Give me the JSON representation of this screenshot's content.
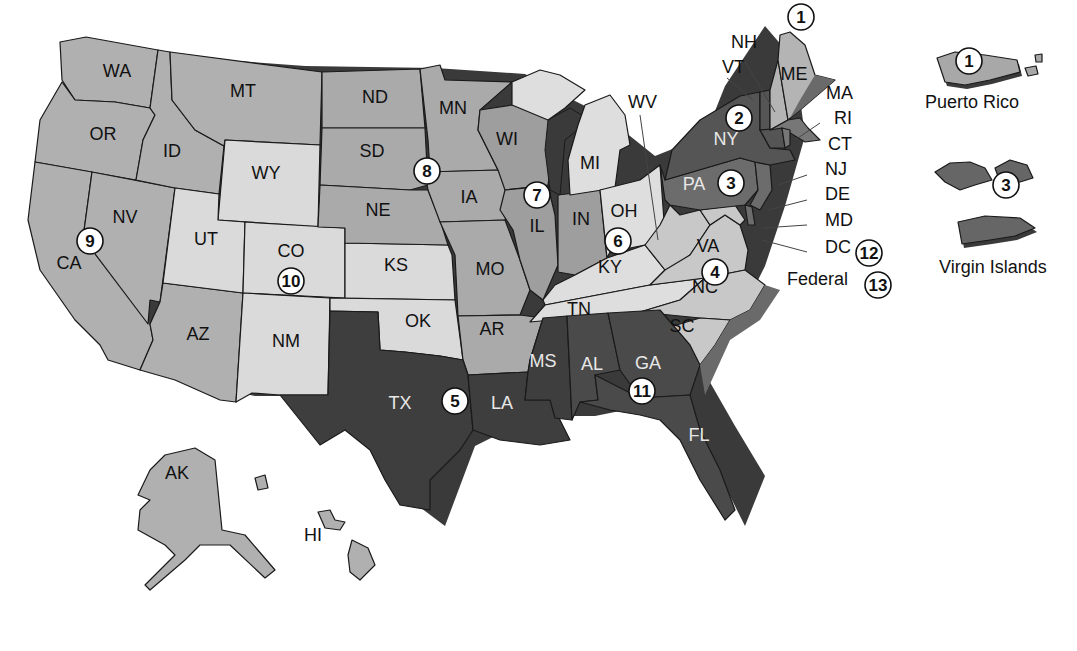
{
  "map": {
    "title": "U.S. Federal Judicial Circuits",
    "colors": {
      "lightest": "#dcdcdc",
      "light": "#c4c4c4",
      "medium": "#a8a8a8",
      "medium_dark": "#7a7a7a",
      "dark": "#5a5a5a",
      "darkest": "#3c3c3c",
      "border": "#1a1a1a",
      "badge_fill": "#ffffff"
    },
    "circuits": [
      {
        "number": "1",
        "states": [
          "ME",
          "NH",
          "MA",
          "RI",
          "Puerto Rico"
        ]
      },
      {
        "number": "2",
        "states": [
          "NY",
          "VT",
          "CT"
        ]
      },
      {
        "number": "3",
        "states": [
          "PA",
          "NJ",
          "DE",
          "Virgin Islands"
        ]
      },
      {
        "number": "4",
        "states": [
          "VA",
          "WV",
          "NC",
          "SC",
          "MD"
        ]
      },
      {
        "number": "5",
        "states": [
          "TX",
          "LA",
          "MS"
        ]
      },
      {
        "number": "6",
        "states": [
          "OH",
          "MI",
          "KY",
          "TN"
        ]
      },
      {
        "number": "7",
        "states": [
          "WI",
          "IL",
          "IN"
        ]
      },
      {
        "number": "8",
        "states": [
          "ND",
          "SD",
          "NE",
          "MN",
          "IA",
          "MO",
          "AR"
        ]
      },
      {
        "number": "9",
        "states": [
          "WA",
          "OR",
          "CA",
          "NV",
          "ID",
          "MT",
          "AZ",
          "AK",
          "HI"
        ]
      },
      {
        "number": "10",
        "states": [
          "WY",
          "UT",
          "CO",
          "KS",
          "OK",
          "NM"
        ]
      },
      {
        "number": "11",
        "states": [
          "AL",
          "GA",
          "FL"
        ]
      },
      {
        "number": "12",
        "states": [
          "DC"
        ]
      },
      {
        "number": "13",
        "states": [
          "Federal"
        ]
      }
    ],
    "state_labels": {
      "WA": "WA",
      "OR": "OR",
      "CA": "CA",
      "NV": "NV",
      "ID": "ID",
      "MT": "MT",
      "WY": "WY",
      "UT": "UT",
      "CO": "CO",
      "AZ": "AZ",
      "NM": "NM",
      "ND": "ND",
      "SD": "SD",
      "NE": "NE",
      "KS": "KS",
      "OK": "OK",
      "TX": "TX",
      "MN": "MN",
      "IA": "IA",
      "MO": "MO",
      "AR": "AR",
      "LA": "LA",
      "WI": "WI",
      "IL": "IL",
      "MI": "MI",
      "IN": "IN",
      "OH": "OH",
      "KY": "KY",
      "TN": "TN",
      "MS": "MS",
      "AL": "AL",
      "GA": "GA",
      "FL": "FL",
      "SC": "SC",
      "NC": "NC",
      "VA": "VA",
      "WV": "WV",
      "PA": "PA",
      "NY": "NY",
      "VT": "VT",
      "NH": "NH",
      "ME": "ME",
      "MA": "MA",
      "RI": "RI",
      "CT": "CT",
      "NJ": "NJ",
      "DE": "DE",
      "MD": "MD",
      "DC": "DC",
      "AK": "AK",
      "HI": "HI"
    },
    "callouts": {
      "federal": "Federal",
      "puerto_rico": "Puerto Rico",
      "virgin_islands": "Virgin Islands"
    },
    "badges": {
      "c1": "1",
      "c1_pr": "1",
      "c2": "2",
      "c3": "3",
      "c3_vi": "3",
      "c4": "4",
      "c5": "5",
      "c6": "6",
      "c7": "7",
      "c8": "8",
      "c9": "9",
      "c10": "10",
      "c11": "11",
      "c12": "12",
      "c13": "13"
    }
  }
}
